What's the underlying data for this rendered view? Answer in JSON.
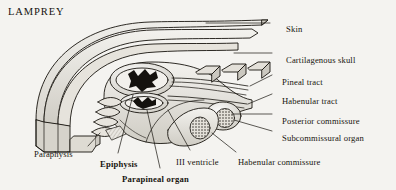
{
  "figure": {
    "title": "LAMPREY",
    "background_color": "#f4f3f0",
    "ink_color": "#17140f"
  },
  "labels": [
    {
      "id": "skin",
      "text": "Skin",
      "x": 286,
      "y": 25,
      "bold": false
    },
    {
      "id": "cartilagenous-skull",
      "text": "Cartilagenous  skull",
      "x": 286,
      "y": 56,
      "bold": false
    },
    {
      "id": "pineal-tract",
      "text": "Pineal tract",
      "x": 282,
      "y": 78,
      "bold": false
    },
    {
      "id": "habenular-tract",
      "text": "Habenular tract",
      "x": 282,
      "y": 97,
      "bold": false
    },
    {
      "id": "posterior-commissure",
      "text": "Posterior commissure",
      "x": 282,
      "y": 117,
      "bold": false
    },
    {
      "id": "subcommissural-organ",
      "text": "Subcommissural organ",
      "x": 282,
      "y": 134,
      "bold": false
    },
    {
      "id": "habenular-commissure",
      "text": "Habenular commissure",
      "x": 238,
      "y": 158,
      "bold": false
    },
    {
      "id": "iii-ventricle",
      "text": "III ventricle",
      "x": 176,
      "y": 158,
      "bold": false
    },
    {
      "id": "paraphysis",
      "text": "Paraphysis",
      "x": 34,
      "y": 150,
      "bold": false
    },
    {
      "id": "epiphysis",
      "text": "Epiphysis",
      "x": 100,
      "y": 160,
      "bold": true
    },
    {
      "id": "parapineal-organ",
      "text": "Parapineal organ",
      "x": 122,
      "y": 175,
      "bold": true
    }
  ],
  "leaders": [
    {
      "id": "leader-skin",
      "from": [
        270,
        23
      ],
      "to": [
        206,
        23
      ]
    },
    {
      "id": "leader-cartilagenous-skull",
      "from": [
        272,
        53
      ],
      "to": [
        232,
        53
      ]
    },
    {
      "id": "leader-pineal-tract",
      "from": [
        272,
        75
      ],
      "to": [
        248,
        86
      ]
    },
    {
      "id": "leader-habenular-tract",
      "from": [
        272,
        94
      ],
      "to": [
        247,
        104
      ]
    },
    {
      "id": "leader-posterior-commissure",
      "from": [
        272,
        114
      ],
      "to": [
        228,
        114
      ]
    },
    {
      "id": "leader-subcommissural-organ",
      "from": [
        272,
        131
      ],
      "to": [
        230,
        120
      ]
    },
    {
      "id": "leader-habenular-commissure",
      "from": [
        236,
        152
      ],
      "to": [
        214,
        132
      ]
    },
    {
      "id": "leader-iii-ventricle",
      "from": [
        190,
        150
      ],
      "to": [
        170,
        112
      ]
    },
    {
      "id": "leader-paraphysis",
      "from": [
        88,
        146
      ],
      "to": [
        100,
        132
      ]
    },
    {
      "id": "leader-epiphysis",
      "from": [
        118,
        153
      ],
      "to": [
        133,
        104
      ]
    },
    {
      "id": "leader-parapineal-organ",
      "from": [
        160,
        168
      ],
      "to": [
        146,
        110
      ]
    }
  ],
  "structures": [
    {
      "id": "skin-layer",
      "name": "Skin"
    },
    {
      "id": "skull-layer",
      "name": "Cartilagenous skull"
    },
    {
      "id": "epiphysis-vesicle",
      "name": "Epiphysis"
    },
    {
      "id": "parapineal-vesicle",
      "name": "Parapineal organ"
    },
    {
      "id": "paraphysis-folds",
      "name": "Paraphysis"
    },
    {
      "id": "pineal-tract-fibers",
      "name": "Pineal tract"
    },
    {
      "id": "habenular-tract-fibers",
      "name": "Habenular tract"
    },
    {
      "id": "subcommissural-stipple",
      "name": "Subcommissural organ"
    },
    {
      "id": "third-ventricle-cavity",
      "name": "III ventricle"
    }
  ]
}
